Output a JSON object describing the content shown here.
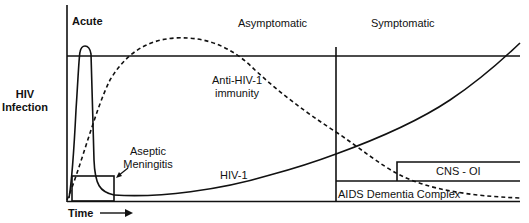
{
  "diagram": {
    "y_axis_label_line1": "HIV",
    "y_axis_label_line2": "Infection",
    "x_axis_label": "Time",
    "x_axis_arrow": "arrow-right",
    "phases": {
      "acute": "Acute",
      "asymptomatic": "Asymptomatic",
      "symptomatic": "Symptomatic"
    },
    "curves": {
      "immunity_line1": "Anti-HIV-1",
      "immunity_line2": "immunity",
      "virus": "HIV-1"
    },
    "boxes": {
      "aseptic_line1": "Aseptic",
      "aseptic_line2": "Meningitis",
      "cns_oi": "CNS - OI",
      "adc": "AIDS Dementia Complex"
    },
    "colors": {
      "stroke": "#111111",
      "background": "#ffffff"
    }
  }
}
